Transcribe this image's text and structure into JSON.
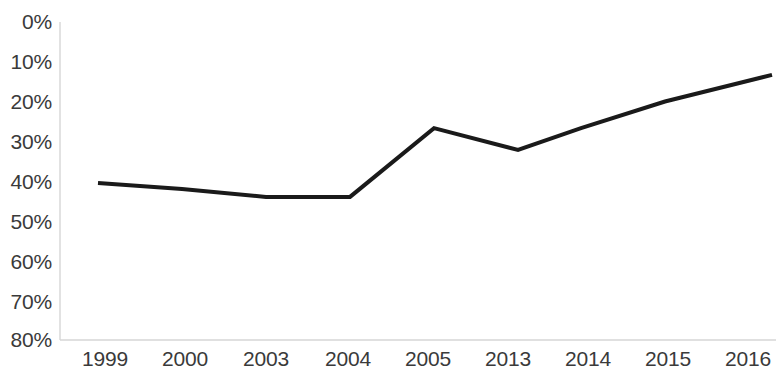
{
  "chart_data": {
    "type": "line",
    "title": "",
    "subtitle": "",
    "xlabel": "",
    "ylabel": "",
    "categories": [
      "1999",
      "2000",
      "2003",
      "2004",
      "2005",
      "2013",
      "2014",
      "2015",
      "2016"
    ],
    "values": [
      39.5,
      38,
      36,
      36,
      53.3,
      47.8,
      53.3,
      60,
      66.7
    ],
    "series": [
      {
        "name": "",
        "values": [
          39.5,
          38,
          36,
          36,
          53.3,
          47.8,
          53.3,
          60,
          66.7
        ]
      }
    ],
    "ylim": [
      0,
      80
    ],
    "ytick_labels": [
      "0%",
      "10%",
      "20%",
      "30%",
      "40%",
      "50%",
      "60%",
      "70%",
      "80%"
    ],
    "ytick_values": [
      0,
      10,
      20,
      30,
      40,
      50,
      60,
      70,
      80
    ],
    "xtick_labels": [
      "1999",
      "2000",
      "2003",
      "2004",
      "2005",
      "2013",
      "2014",
      "2015",
      "2016"
    ],
    "grid": false,
    "legend": "none",
    "value_format": "percent",
    "line_color": "#1a1a1a",
    "axis_color": "#d6d6d6",
    "text_color": "#3a3a3a",
    "background_color": "#ffffff",
    "markers": false,
    "line_width": 4
  },
  "geometry": {
    "plot_left": 60,
    "plot_right": 776,
    "plot_top": 22,
    "plot_bottom": 340,
    "first_point_x": 98,
    "last_point_x": 772,
    "x_positions": [
      98,
      182,
      266,
      350,
      434,
      518,
      581,
      665,
      772
    ],
    "y_label_positions": [
      22,
      62,
      102,
      142,
      182,
      222,
      262,
      302,
      340
    ],
    "x_label_positions": [
      105,
      185,
      266,
      348,
      428,
      508,
      588,
      668,
      748
    ],
    "x_label_top": 348
  }
}
